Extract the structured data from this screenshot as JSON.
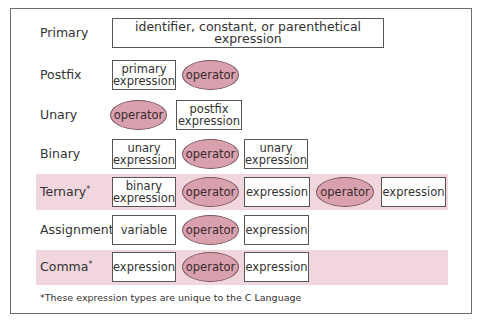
{
  "colors": {
    "highlight_band": "#f1d6dd",
    "operator_fill": "#d9a1ad",
    "box_border": "#555555"
  },
  "rows": {
    "primary": {
      "label": "Primary",
      "box": "identifier, constant, or parenthetical expression"
    },
    "postfix": {
      "label": "Postfix",
      "box1_l1": "primary",
      "box1_l2": "expression",
      "op": "operator"
    },
    "unary": {
      "label": "Unary",
      "op": "operator",
      "box1_l1": "postfix",
      "box1_l2": "expression"
    },
    "binary": {
      "label": "Binary",
      "box1_l1": "unary",
      "box1_l2": "expression",
      "op": "operator",
      "box2_l1": "unary",
      "box2_l2": "expression"
    },
    "ternary": {
      "label": "Ternary",
      "mark": "*",
      "box1_l1": "binary",
      "box1_l2": "expression",
      "op1": "operator",
      "box2": "expression",
      "op2": "operator",
      "box3": "expression"
    },
    "assignment": {
      "label": "Assignment",
      "box1": "variable",
      "op": "operator",
      "box2": "expression"
    },
    "comma": {
      "label": "Comma",
      "mark": "*",
      "box1": "expression",
      "op": "operator",
      "box2": "expression"
    }
  },
  "footnote": "*These expression types are unique to the C Language"
}
